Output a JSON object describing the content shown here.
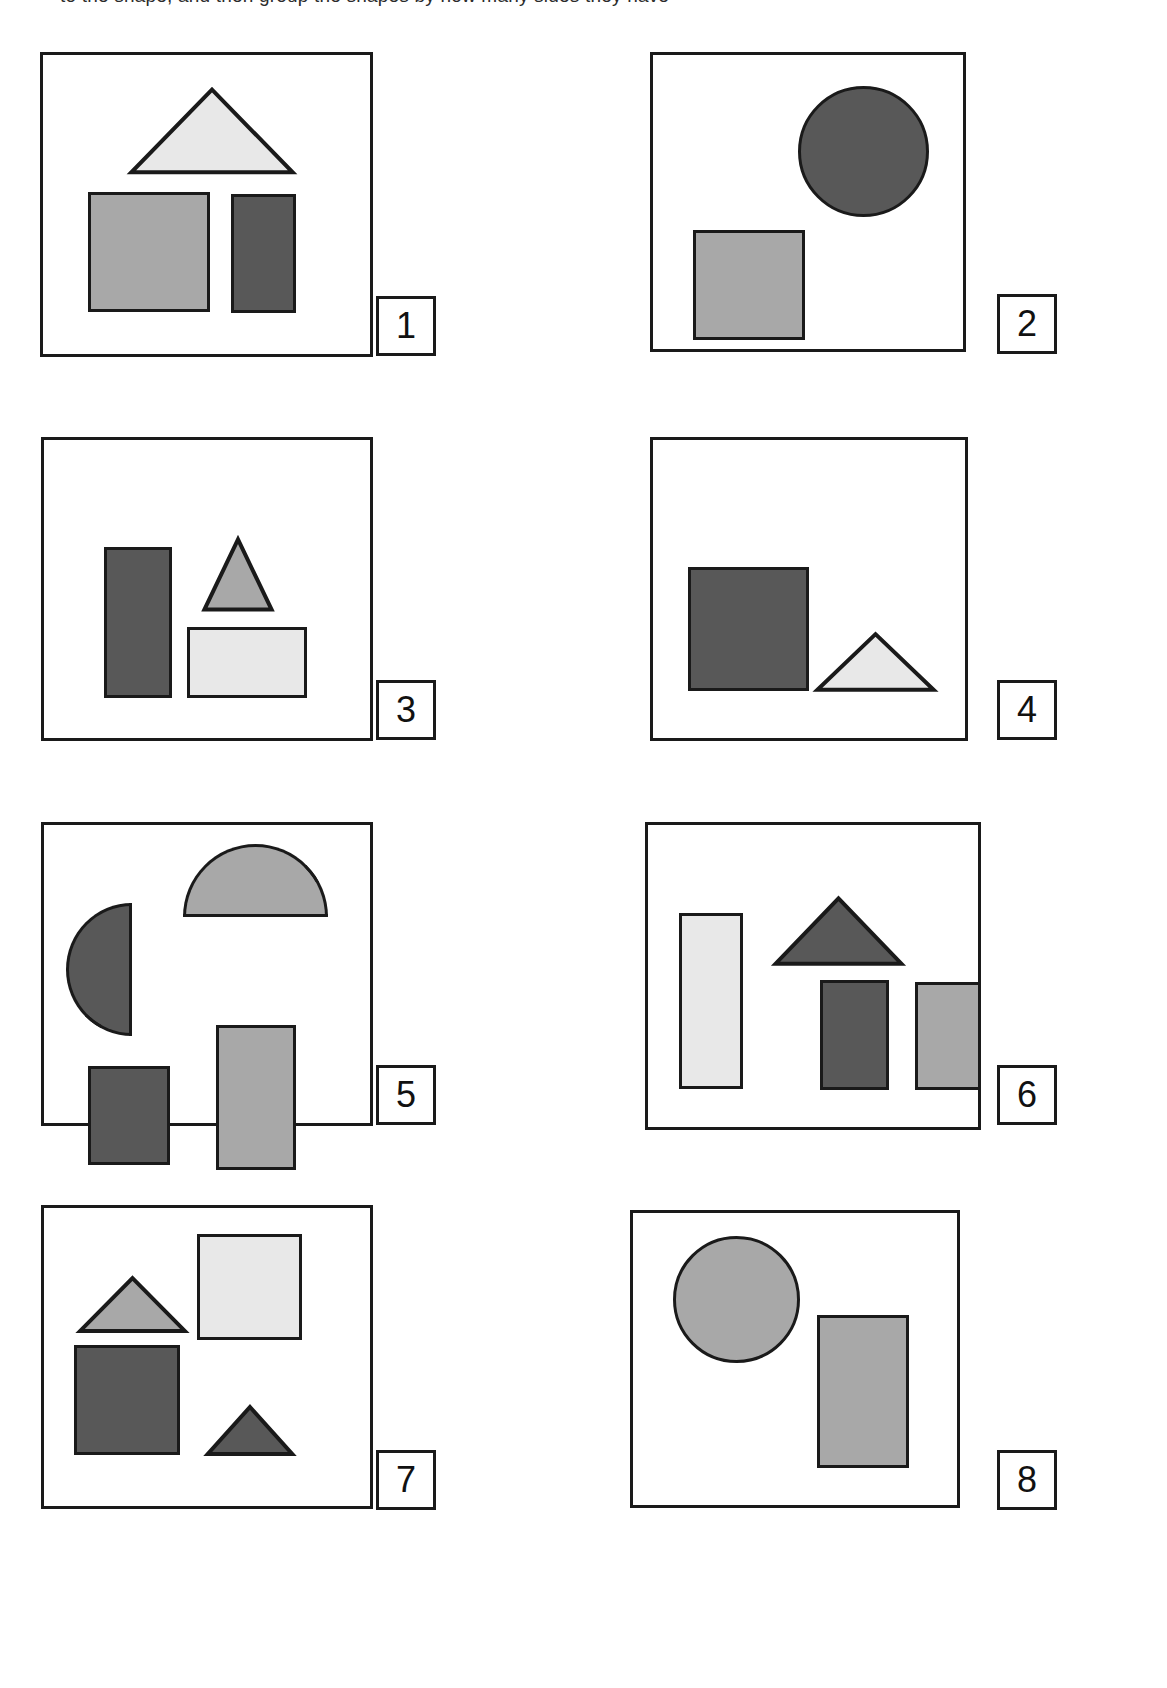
{
  "page": {
    "width": 1167,
    "height": 1688,
    "background": "#ffffff",
    "header_clipped_text": "to the shape, and then group the shapes by how many sides they have"
  },
  "palette": {
    "outline": "#1a1a1a",
    "light_gray": "#e8e8e8",
    "medium_gray": "#a8a8a8",
    "dark_gray": "#585858",
    "white": "#ffffff"
  },
  "panels": [
    {
      "number": "1",
      "box": {
        "x": 40,
        "y": 52,
        "w": 333,
        "h": 305
      },
      "label_box": {
        "x": 376,
        "y": 296,
        "w": 60,
        "h": 60
      },
      "shapes": [
        {
          "name": "triangle-light",
          "type": "triangle",
          "fill": "light_gray",
          "x": 128,
          "y": 88,
          "w": 168,
          "h": 86
        },
        {
          "name": "square-medium",
          "type": "rect",
          "fill": "medium_gray",
          "x": 88,
          "y": 192,
          "w": 122,
          "h": 120
        },
        {
          "name": "rect-dark",
          "type": "rect",
          "fill": "dark_gray",
          "x": 231,
          "y": 194,
          "w": 65,
          "h": 119
        }
      ]
    },
    {
      "number": "2",
      "box": {
        "x": 650,
        "y": 52,
        "w": 316,
        "h": 300
      },
      "label_box": {
        "x": 997,
        "y": 294,
        "w": 60,
        "h": 60
      },
      "shapes": [
        {
          "name": "circle-dark",
          "type": "circle",
          "fill": "dark_gray",
          "x": 798,
          "y": 86,
          "w": 131,
          "h": 131
        },
        {
          "name": "square-medium",
          "type": "rect",
          "fill": "medium_gray",
          "x": 693,
          "y": 230,
          "w": 112,
          "h": 110
        }
      ]
    },
    {
      "number": "3",
      "box": {
        "x": 41,
        "y": 437,
        "w": 332,
        "h": 304
      },
      "label_box": {
        "x": 376,
        "y": 680,
        "w": 60,
        "h": 60
      },
      "shapes": [
        {
          "name": "rect-dark-tall",
          "type": "rect",
          "fill": "dark_gray",
          "x": 104,
          "y": 547,
          "w": 68,
          "h": 151
        },
        {
          "name": "triangle-medium",
          "type": "triangle",
          "fill": "medium_gray",
          "x": 203,
          "y": 538,
          "w": 70,
          "h": 73
        },
        {
          "name": "square-light",
          "type": "rect",
          "fill": "light_gray",
          "x": 187,
          "y": 627,
          "w": 120,
          "h": 71
        }
      ]
    },
    {
      "number": "4",
      "box": {
        "x": 650,
        "y": 437,
        "w": 318,
        "h": 304
      },
      "label_box": {
        "x": 997,
        "y": 680,
        "w": 60,
        "h": 60
      },
      "shapes": [
        {
          "name": "square-dark",
          "type": "rect",
          "fill": "dark_gray",
          "x": 688,
          "y": 567,
          "w": 121,
          "h": 124
        },
        {
          "name": "triangle-light",
          "type": "triangle",
          "fill": "light_gray",
          "x": 815,
          "y": 633,
          "w": 121,
          "h": 58
        }
      ]
    },
    {
      "number": "5",
      "box": {
        "x": 41,
        "y": 822,
        "w": 332,
        "h": 304
      },
      "label_box": {
        "x": 376,
        "y": 1065,
        "w": 60,
        "h": 60
      },
      "shapes": [
        {
          "name": "semicircle-dark-left",
          "type": "semicircle-left",
          "fill": "dark_gray",
          "x": 66,
          "y": 903,
          "w": 66,
          "h": 133
        },
        {
          "name": "semicircle-medium-up",
          "type": "semicircle-up",
          "fill": "medium_gray",
          "x": 183,
          "y": 844,
          "w": 145,
          "h": 73
        },
        {
          "name": "rect-medium",
          "type": "rect",
          "fill": "medium_gray",
          "x": 216,
          "y": 1025,
          "w": 80,
          "h": 145
        },
        {
          "name": "rect-dark",
          "type": "rect",
          "fill": "dark_gray",
          "x": 88,
          "y": 1066,
          "w": 82,
          "h": 99
        }
      ]
    },
    {
      "number": "6",
      "box": {
        "x": 645,
        "y": 822,
        "w": 336,
        "h": 308
      },
      "label_box": {
        "x": 997,
        "y": 1065,
        "w": 60,
        "h": 60
      },
      "shapes": [
        {
          "name": "rect-light-tall",
          "type": "rect",
          "fill": "light_gray",
          "x": 679,
          "y": 913,
          "w": 64,
          "h": 176
        },
        {
          "name": "triangle-dark",
          "type": "triangle",
          "fill": "dark_gray",
          "x": 773,
          "y": 897,
          "w": 131,
          "h": 68
        },
        {
          "name": "rect-dark",
          "type": "rect",
          "fill": "dark_gray",
          "x": 820,
          "y": 980,
          "w": 69,
          "h": 110
        },
        {
          "name": "rect-medium",
          "type": "rect",
          "fill": "medium_gray",
          "x": 915,
          "y": 982,
          "w": 66,
          "h": 108
        }
      ]
    },
    {
      "number": "7",
      "box": {
        "x": 41,
        "y": 1205,
        "w": 332,
        "h": 304
      },
      "label_box": {
        "x": 376,
        "y": 1450,
        "w": 60,
        "h": 60
      },
      "shapes": [
        {
          "name": "triangle-medium",
          "type": "triangle",
          "fill": "medium_gray",
          "x": 78,
          "y": 1277,
          "w": 109,
          "h": 55
        },
        {
          "name": "square-light",
          "type": "rect",
          "fill": "light_gray",
          "x": 197,
          "y": 1234,
          "w": 105,
          "h": 106
        },
        {
          "name": "square-dark",
          "type": "rect",
          "fill": "dark_gray",
          "x": 74,
          "y": 1345,
          "w": 106,
          "h": 110
        },
        {
          "name": "triangle-dark",
          "type": "triangle",
          "fill": "dark_gray",
          "x": 206,
          "y": 1406,
          "w": 88,
          "h": 49
        }
      ]
    },
    {
      "number": "8",
      "box": {
        "x": 630,
        "y": 1210,
        "w": 330,
        "h": 298
      },
      "label_box": {
        "x": 997,
        "y": 1450,
        "w": 60,
        "h": 60
      },
      "shapes": [
        {
          "name": "circle-medium",
          "type": "circle",
          "fill": "medium_gray",
          "x": 673,
          "y": 1236,
          "w": 127,
          "h": 127
        },
        {
          "name": "rect-medium",
          "type": "rect",
          "fill": "medium_gray",
          "x": 817,
          "y": 1315,
          "w": 92,
          "h": 153
        }
      ]
    }
  ]
}
